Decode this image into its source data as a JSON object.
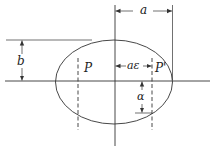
{
  "diagram": {
    "labels": {
      "semi_major": "a",
      "semi_minor": "b",
      "focal_distance": "aε",
      "focus_left": "P",
      "focus_right": "P'",
      "angle": "α"
    },
    "colors": {
      "stroke": "#333333",
      "background": "#ffffff"
    }
  }
}
